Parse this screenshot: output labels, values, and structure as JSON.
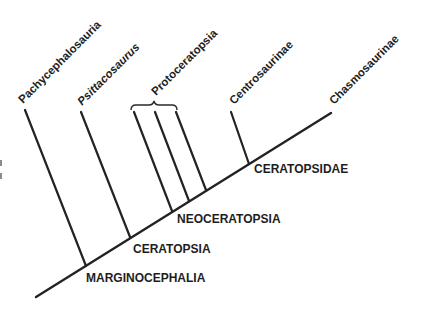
{
  "diagram": {
    "type": "cladogram",
    "colors": {
      "line": "#232323",
      "text": "#1e1e1e",
      "background": "#ffffff"
    },
    "terminal_taxa": [
      {
        "name": "Pachycephalosauria",
        "italic": false
      },
      {
        "name": "Psittacosaurus",
        "italic": true
      },
      {
        "name": "Protoceratopsia",
        "italic": false,
        "branches": 3,
        "bracketed": true
      },
      {
        "name": "Centrosaurinae",
        "italic": false
      },
      {
        "name": "Chasmosaurinae",
        "italic": false
      }
    ],
    "clade_nodes": [
      {
        "name": "MARGINOCEPHALIA"
      },
      {
        "name": "CERATOPSIA"
      },
      {
        "name": "NEOCERATOPSIA"
      },
      {
        "name": "CERATOPSIDAE"
      }
    ]
  }
}
